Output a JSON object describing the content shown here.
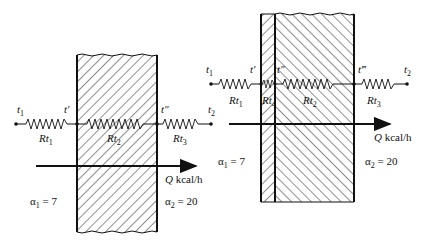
{
  "diagram_left": {
    "name": "single-wall",
    "t1": "t",
    "t1_sub": "1",
    "t_prime": "t′",
    "t_dprime": "t″",
    "t2": "t",
    "t2_sub": "2",
    "r1": "Rt",
    "r1_sub": "1",
    "r2": "Rt",
    "r2_sub": "2",
    "r3": "Rt",
    "r3_sub": "3",
    "q_symbol": "Q",
    "q_unit": "kcal/h",
    "alpha1": "α",
    "alpha1_sub": "1",
    "alpha1_value": " = 7",
    "alpha2": "α",
    "alpha2_sub": "2",
    "alpha2_value": " = 20"
  },
  "diagram_right": {
    "name": "composite-wall",
    "t1": "t",
    "t1_sub": "1",
    "t_prime": "t′",
    "t_dprime": "t″",
    "t_tprime": "t‴",
    "t2": "t",
    "t2_sub": "2",
    "r1": "Rt",
    "r1_sub": "1",
    "r4": "Rt",
    "r4_sub": "4",
    "r2": "Rt",
    "r2_sub": "2",
    "r3": "Rt",
    "r3_sub": "3",
    "q_symbol": "Q",
    "q_unit": "kcal/h",
    "alpha1": "α",
    "alpha1_sub": "1",
    "alpha1_value": " = 7",
    "alpha2": "α",
    "alpha2_sub": "2",
    "alpha2_value": " = 20"
  }
}
